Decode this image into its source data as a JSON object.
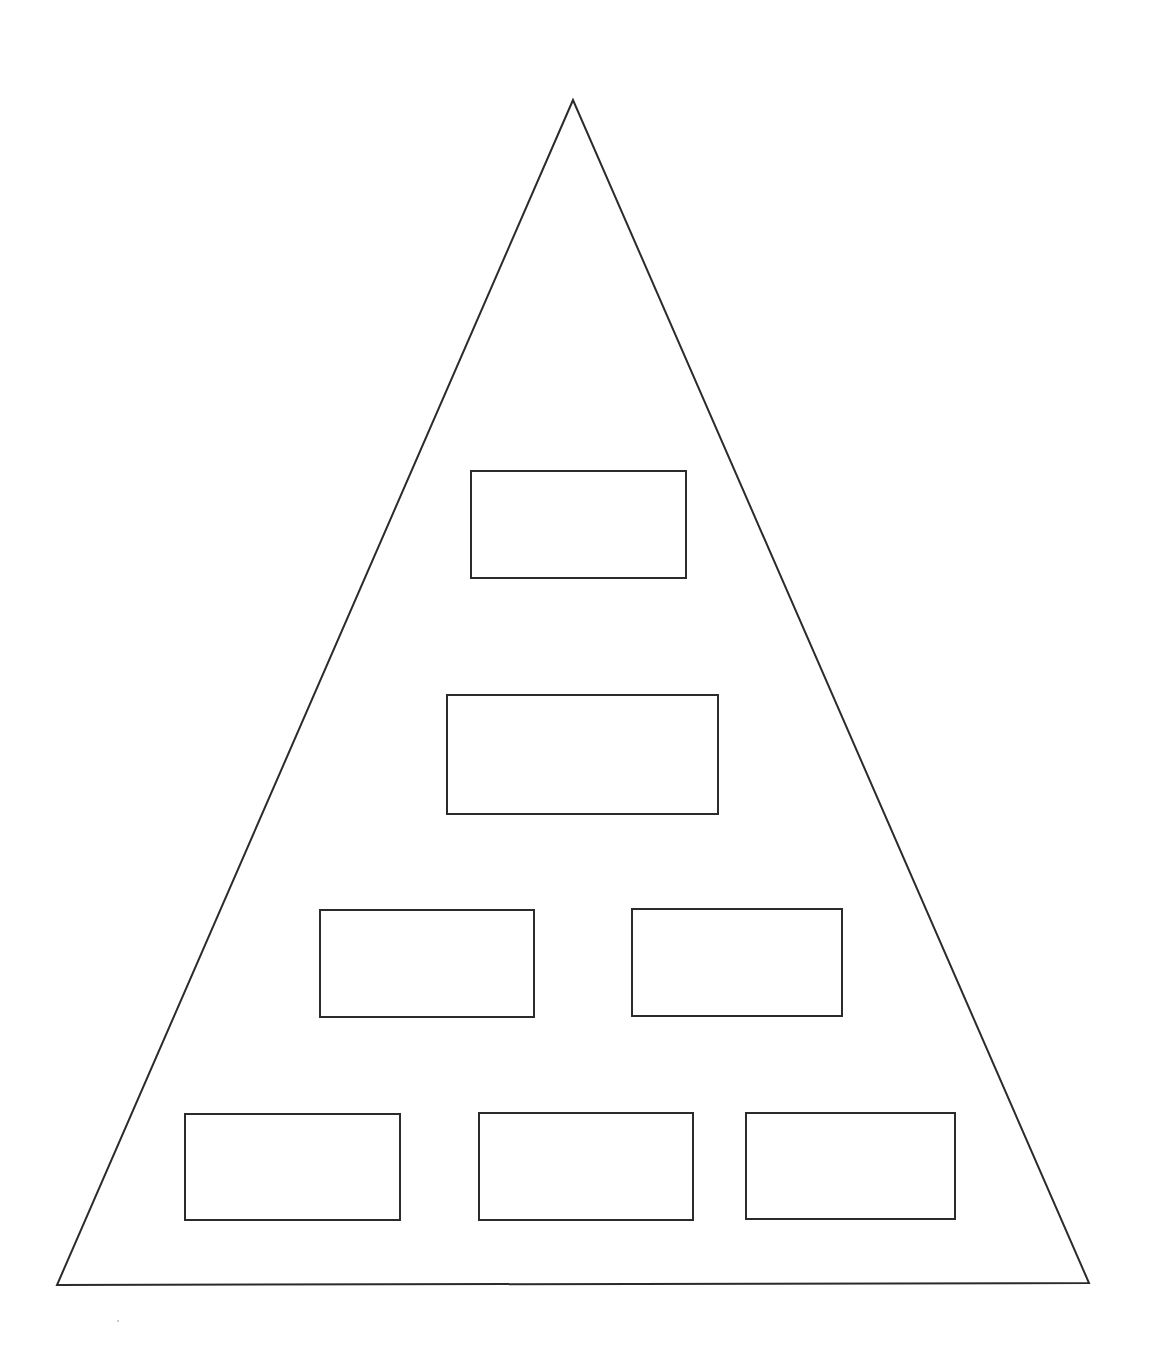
{
  "diagram": {
    "type": "pyramid-hierarchy",
    "stroke_color": "#2b2b2b",
    "background_color": "#ffffff",
    "triangle": {
      "apex": [
        573,
        100
      ],
      "bottom_left": [
        57,
        1285
      ],
      "bottom_right": [
        1089,
        1283
      ]
    },
    "levels": [
      {
        "level": 1,
        "boxes": [
          {
            "label": "",
            "x": 470,
            "y": 470,
            "w": 217,
            "h": 109
          }
        ]
      },
      {
        "level": 2,
        "boxes": [
          {
            "label": "",
            "x": 446,
            "y": 694,
            "w": 273,
            "h": 121
          }
        ]
      },
      {
        "level": 3,
        "boxes": [
          {
            "label": "",
            "x": 319,
            "y": 909,
            "w": 216,
            "h": 109
          },
          {
            "label": "",
            "x": 631,
            "y": 908,
            "w": 212,
            "h": 109
          }
        ]
      },
      {
        "level": 4,
        "boxes": [
          {
            "label": "",
            "x": 184,
            "y": 1113,
            "w": 217,
            "h": 108
          },
          {
            "label": "",
            "x": 478,
            "y": 1112,
            "w": 216,
            "h": 109
          },
          {
            "label": "",
            "x": 745,
            "y": 1112,
            "w": 211,
            "h": 108
          }
        ]
      }
    ]
  }
}
